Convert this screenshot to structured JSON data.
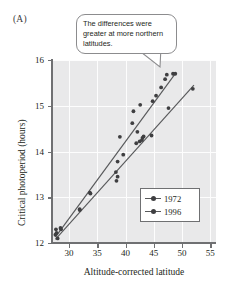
{
  "panel": {
    "label": "(A)"
  },
  "callout": {
    "text": "The differences were greater at more northern latitudes."
  },
  "legend": {
    "entries": [
      {
        "label": "1972",
        "marker": "line-dot-marker",
        "color": "#58595b"
      },
      {
        "label": "1996",
        "marker": "line-dot-marker",
        "color": "#58595b"
      }
    ]
  },
  "chart_data": {
    "type": "scatter",
    "title": "",
    "xlabel": "Altitude-corrected latitude",
    "ylabel": "Critical photoperiod (hours)",
    "xlim": [
      27,
      56
    ],
    "ylim": [
      12,
      16
    ],
    "xticks": [
      30,
      35,
      40,
      45,
      50,
      55
    ],
    "yticks": [
      12,
      13,
      14,
      15,
      16
    ],
    "xtick_labels": [
      "30",
      "35",
      "40",
      "45",
      "50",
      "55"
    ],
    "ytick_labels": [
      "12",
      "13",
      "14",
      "15",
      "16"
    ],
    "grid": "white gridlines on gray panel",
    "legend_position": "lower-right inside axes",
    "plot_background": "#e9e9ea",
    "point_color": "#3f3f41",
    "line_color": "#58595b",
    "annotations": [
      {
        "text": "The differences were greater at more northern latitudes.",
        "points_to": {
          "x": 47.2,
          "y": 15.55
        }
      }
    ],
    "series": [
      {
        "name": "1972",
        "marker": "filled-circle",
        "fit_line": {
          "x": [
            27.6,
            48.9
          ],
          "y": [
            12.13,
            15.72
          ]
        },
        "points": [
          {
            "x": 27.6,
            "y": 12.18
          },
          {
            "x": 27.7,
            "y": 12.3
          },
          {
            "x": 28.0,
            "y": 12.1
          },
          {
            "x": 28.5,
            "y": 12.33
          },
          {
            "x": 31.9,
            "y": 12.74
          },
          {
            "x": 33.7,
            "y": 13.1
          },
          {
            "x": 38.3,
            "y": 13.55
          },
          {
            "x": 38.6,
            "y": 13.78
          },
          {
            "x": 39.0,
            "y": 14.32
          },
          {
            "x": 39.6,
            "y": 13.93
          },
          {
            "x": 41.2,
            "y": 14.62
          },
          {
            "x": 41.4,
            "y": 14.88
          },
          {
            "x": 42.1,
            "y": 14.43
          },
          {
            "x": 42.6,
            "y": 15.02
          },
          {
            "x": 43.0,
            "y": 14.3
          },
          {
            "x": 44.8,
            "y": 15.1
          },
          {
            "x": 45.4,
            "y": 15.22
          },
          {
            "x": 46.3,
            "y": 15.4
          },
          {
            "x": 47.0,
            "y": 15.58
          },
          {
            "x": 47.3,
            "y": 15.68
          },
          {
            "x": 48.4,
            "y": 15.7
          },
          {
            "x": 48.8,
            "y": 15.7
          }
        ]
      },
      {
        "name": "1996",
        "marker": "filled-circle",
        "fit_line": {
          "x": [
            27.6,
            52.1
          ],
          "y": [
            12.08,
            15.45
          ]
        },
        "points": [
          {
            "x": 27.8,
            "y": 12.22
          },
          {
            "x": 28.6,
            "y": 12.3
          },
          {
            "x": 31.9,
            "y": 12.72
          },
          {
            "x": 33.8,
            "y": 13.08
          },
          {
            "x": 38.4,
            "y": 13.36
          },
          {
            "x": 38.6,
            "y": 13.45
          },
          {
            "x": 41.9,
            "y": 14.18
          },
          {
            "x": 42.5,
            "y": 14.22
          },
          {
            "x": 42.9,
            "y": 14.25
          },
          {
            "x": 43.2,
            "y": 14.33
          },
          {
            "x": 44.6,
            "y": 14.35
          },
          {
            "x": 47.6,
            "y": 14.95
          },
          {
            "x": 51.9,
            "y": 15.37
          }
        ]
      }
    ]
  }
}
